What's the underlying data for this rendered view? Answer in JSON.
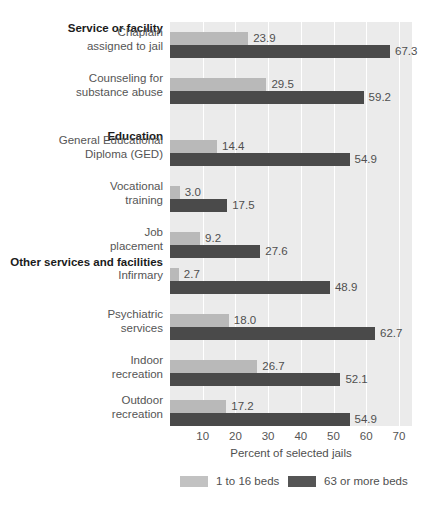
{
  "chart_data": {
    "type": "bar",
    "orientation": "horizontal",
    "title": "",
    "xlabel": "Percent of selected jails",
    "ylabel": "",
    "xlim": [
      0,
      74
    ],
    "xticks": [
      10,
      20,
      30,
      40,
      50,
      60,
      70
    ],
    "grid": "vertical",
    "legend_position": "bottom",
    "series": [
      {
        "name": "1 to 16 beds",
        "color": "#b9b9b9",
        "values": [
          23.9,
          29.5,
          14.4,
          3.0,
          9.2,
          2.7,
          18.0,
          26.7,
          17.2
        ]
      },
      {
        "name": "63 or more beds",
        "color": "#4a4a4a",
        "values": [
          67.3,
          59.2,
          54.9,
          17.5,
          27.6,
          48.9,
          62.7,
          52.1,
          54.9
        ]
      }
    ],
    "categories": [
      "Chaplain assigned to jail",
      "Counseling for substance abuse",
      "General Educational Diploma (GED)",
      "Vocational training",
      "Job placement",
      "Infirmary",
      "Psychiatric services",
      "Indoor recreation",
      "Outdoor recreation"
    ],
    "section_headings": [
      {
        "label": "Service or facility",
        "before_category": "Chaplain assigned to jail"
      },
      {
        "label": "Education",
        "before_category": "General Educational Diploma (GED)"
      },
      {
        "label": "Other services and facilities",
        "before_category": "Infirmary"
      }
    ]
  },
  "sections": {
    "s1": "Service or facility",
    "s2": "Education",
    "s3": "Other services and facilities"
  },
  "rows": [
    {
      "l1": "Chaplain",
      "l2": "assigned to jail",
      "light": "23.9",
      "dark": "67.3"
    },
    {
      "l1": "Counseling for",
      "l2": "substance abuse",
      "light": "29.5",
      "dark": "59.2"
    },
    {
      "l1": "General Educational",
      "l2": "Diploma (GED)",
      "light": "14.4",
      "dark": "54.9"
    },
    {
      "l1": "Vocational",
      "l2": "training",
      "light": "3.0",
      "dark": "17.5"
    },
    {
      "l1": "Job",
      "l2": "placement",
      "light": "9.2",
      "dark": "27.6"
    },
    {
      "l1": "Infirmary",
      "l2": "",
      "light": "2.7",
      "dark": "48.9"
    },
    {
      "l1": "Psychiatric",
      "l2": "services",
      "light": "18.0",
      "dark": "62.7"
    },
    {
      "l1": "Indoor",
      "l2": "recreation",
      "light": "26.7",
      "dark": "52.1"
    },
    {
      "l1": "Outdoor",
      "l2": "recreation",
      "light": "17.2",
      "dark": "54.9"
    }
  ],
  "axis": {
    "ticks": [
      "10",
      "20",
      "30",
      "40",
      "50",
      "60",
      "70"
    ],
    "title": "Percent of selected jails"
  },
  "legend": {
    "items": [
      {
        "label": "1 to 16 beds",
        "color": "#c2c2c2"
      },
      {
        "label": "63 or more beds",
        "color": "#555555"
      }
    ]
  }
}
